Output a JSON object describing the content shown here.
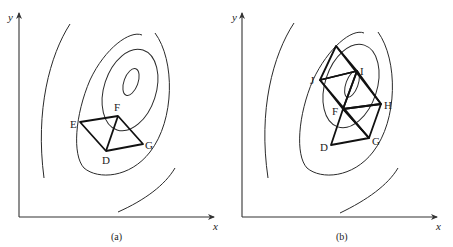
{
  "figure": {
    "panels": [
      {
        "id": "a",
        "caption": "(a)",
        "x_label": "x",
        "y_label": "y",
        "points": {
          "E": "E",
          "F": "F",
          "G": "G",
          "D": "D"
        }
      },
      {
        "id": "b",
        "caption": "(b)",
        "x_label": "x",
        "y_label": "y",
        "points": {
          "I": "I",
          "J": "J",
          "H": "H",
          "F": "F",
          "G": "G",
          "D": "D"
        }
      }
    ]
  }
}
